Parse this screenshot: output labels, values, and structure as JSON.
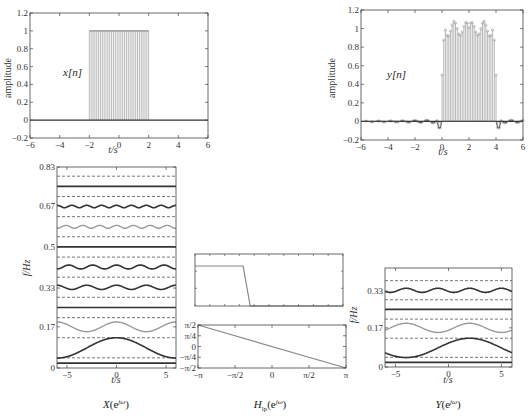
{
  "colors": {
    "axis": "#444444",
    "dark_line": "#333333",
    "gray_line": "#9a9a9a",
    "stem": "#b0b0b0",
    "dashed": "#555555"
  },
  "chart_data": [
    {
      "id": "x_n",
      "type": "stem",
      "title": "x[n]",
      "xlabel": "t/s",
      "ylabel": "amplitude",
      "xlim": [
        -6,
        6
      ],
      "ylim": [
        -0.2,
        1.2
      ],
      "xticks": [
        -6,
        -4,
        -2,
        0,
        2,
        4,
        6
      ],
      "yticks": [
        -0.2,
        0,
        0.2,
        0.4,
        0.6,
        0.8,
        1,
        1.2
      ],
      "ytick_labels": [
        "-0.2",
        "0",
        "0.2",
        "0.4",
        "0.6",
        "0.8",
        "1",
        "1.2"
      ],
      "description": "Rectangular pulse: value 1 for -2 <= t <= 2, 0 elsewhere",
      "pulse": {
        "start": -2,
        "end": 2,
        "amplitude": 1,
        "step": 0.125
      }
    },
    {
      "id": "y_n",
      "type": "stem",
      "title": "y[n]",
      "xlabel": "t/s",
      "ylabel": "amplitude",
      "xlim": [
        -6,
        6
      ],
      "ylim": [
        -0.2,
        1.2
      ],
      "xticks": [
        -6,
        -4,
        -2,
        0,
        2,
        4,
        6
      ],
      "yticks": [
        -0.2,
        0,
        0.2,
        0.4,
        0.6,
        0.8,
        1,
        1.2
      ],
      "ytick_labels": [
        "-0.2",
        "0",
        "0.2",
        "0.4",
        "0.6",
        "0.8",
        "1",
        "1.2"
      ],
      "description": "Low-pass filtered, delayed pulse: ~1 for 0 <= t <= 4 with Gibbs ripple (peaks ~1.09 near edges), small ripple outside",
      "pulse": {
        "start": 0,
        "end": 4,
        "amplitude": 1,
        "step": 0.125,
        "overshoot": 0.09
      }
    },
    {
      "id": "X_spectrum",
      "type": "line",
      "caption": "X(e^jω)",
      "xlabel": "t/s",
      "ylabel": "f/Hz",
      "xlim": [
        -6,
        6
      ],
      "ylim": [
        0,
        0.83
      ],
      "xticks": [
        -5,
        0,
        5
      ],
      "yticks": [
        0,
        0.17,
        0.33,
        0.5,
        0.67,
        0.83
      ],
      "ytick_labels": [
        "0",
        "0.17",
        "0.33",
        "0.5",
        "0.67",
        "0.83"
      ],
      "dashed_levels": [
        0.042,
        0.125,
        0.208,
        0.292,
        0.375,
        0.458,
        0.542,
        0.625,
        0.708,
        0.792
      ],
      "series": [
        {
          "name": "f0",
          "base": 0.02,
          "amp": 0,
          "period": 12,
          "phase": 0,
          "color": "dark",
          "width": 1.8
        },
        {
          "name": "f1",
          "base": 0.083,
          "amp": 0.042,
          "period": 12,
          "phase": 0,
          "color": "dark",
          "width": 1.6,
          "shape": "bump"
        },
        {
          "name": "f2",
          "base": 0.17,
          "amp": 0.02,
          "period": 6,
          "phase": 0,
          "color": "gray",
          "width": 1.4
        },
        {
          "name": "f3",
          "base": 0.25,
          "amp": 0,
          "period": 12,
          "phase": 0,
          "color": "dark",
          "width": 1.6
        },
        {
          "name": "f4",
          "base": 0.333,
          "amp": 0.009,
          "period": 3,
          "phase": 0,
          "color": "dark",
          "width": 1.6
        },
        {
          "name": "f5",
          "base": 0.417,
          "amp": 0.008,
          "period": 2.4,
          "phase": 0,
          "color": "dark",
          "width": 1.6
        },
        {
          "name": "f6",
          "base": 0.5,
          "amp": 0,
          "period": 12,
          "phase": 0,
          "color": "dark",
          "width": 1.6
        },
        {
          "name": "f7",
          "base": 0.583,
          "amp": 0.006,
          "period": 1.7,
          "phase": 0,
          "color": "gray",
          "width": 1.4
        },
        {
          "name": "f8",
          "base": 0.667,
          "amp": 0.005,
          "period": 1.5,
          "phase": 0,
          "color": "dark",
          "width": 1.6
        },
        {
          "name": "f9",
          "base": 0.75,
          "amp": 0,
          "period": 12,
          "phase": 0,
          "color": "dark",
          "width": 1.6
        }
      ]
    },
    {
      "id": "H_lp_magnitude",
      "type": "line",
      "caption": "H_lp(e^jω)",
      "xlim": [
        -3.1416,
        3.1416
      ],
      "ylim": [
        0,
        1.3
      ],
      "description": "Low-pass magnitude: 1 from -π to about -0.35π, dropping to 0 at about -0.25π",
      "points": [
        [
          -3.1416,
          1
        ],
        [
          -1.1,
          1
        ],
        [
          -0.8,
          0
        ],
        [
          3.1416,
          0
        ]
      ]
    },
    {
      "id": "H_lp_phase",
      "type": "line",
      "xlim": [
        -3.1416,
        3.1416
      ],
      "ylim": [
        -1.5708,
        1.5708
      ],
      "xticks": [
        -3.1416,
        -1.5708,
        0,
        1.5708,
        3.1416
      ],
      "xtick_labels": [
        "−π",
        "−π/2",
        "0",
        "π/2",
        "π"
      ],
      "yticks": [
        -1.5708,
        -0.7854,
        0,
        0.7854,
        1.5708
      ],
      "ytick_labels": [
        "−π/2",
        "−π/4",
        "0",
        "π/4",
        "π/2"
      ],
      "description": "Linear phase from π/2 at ω=−π to −π/2 at ω=π",
      "points": [
        [
          -3.1416,
          1.5708
        ],
        [
          3.1416,
          -1.5708
        ]
      ]
    },
    {
      "id": "Y_spectrum",
      "type": "line",
      "caption": "Y(e^jω)",
      "xlabel": "t/s",
      "ylabel": "f/Hz",
      "xlim": [
        -6,
        6
      ],
      "ylim": [
        0,
        0.43
      ],
      "xticks": [
        -5,
        0,
        5
      ],
      "yticks": [
        0,
        0.17,
        0.33
      ],
      "ytick_labels": [
        "0",
        "0.17",
        "0.33"
      ],
      "dashed_levels": [
        0.042,
        0.125,
        0.208,
        0.292,
        0.375
      ],
      "series": [
        {
          "name": "f0",
          "base": 0.02,
          "amp": 0,
          "period": 12,
          "phase": 0,
          "color": "dark",
          "width": 1.8
        },
        {
          "name": "f1",
          "base": 0.083,
          "amp": 0.042,
          "period": 12,
          "phase": 2,
          "color": "dark",
          "width": 1.6,
          "shape": "bump"
        },
        {
          "name": "f2",
          "base": 0.17,
          "amp": 0.02,
          "period": 6,
          "phase": 2,
          "color": "gray",
          "width": 1.4
        },
        {
          "name": "f3",
          "base": 0.25,
          "amp": 0,
          "period": 12,
          "phase": 0,
          "color": "dark",
          "width": 1.6
        },
        {
          "name": "f4",
          "base": 0.333,
          "amp": 0.009,
          "period": 3,
          "phase": 2,
          "color": "dark",
          "width": 1.6
        }
      ]
    }
  ],
  "labels": {
    "x_signal": "x[n]",
    "y_signal": "y[n]",
    "amplitude": "amplitude",
    "time": "t/s",
    "freq": "f/Hz",
    "caption_X": "X(e",
    "caption_H_base": "H",
    "caption_H_sub": "lp",
    "caption_H_rest": "(e",
    "caption_Y": "Y(e",
    "jw": "jω",
    "close_paren": ")"
  }
}
